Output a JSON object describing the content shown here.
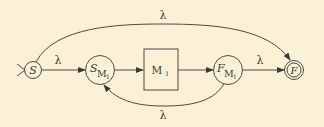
{
  "diagram": {
    "type": "state-transition (NFA construction for M1*)",
    "colors": {
      "background": "#fbf1d6",
      "stroke": "#4a4a4a",
      "text": "#3a3a3a"
    },
    "nodes": [
      {
        "id": "S",
        "label": "S",
        "kind": "start-state"
      },
      {
        "id": "S_M1",
        "label": "S",
        "sub": "M",
        "subsub": "1",
        "kind": "state"
      },
      {
        "id": "M1",
        "label": "M",
        "sub": "1",
        "kind": "machine-box"
      },
      {
        "id": "F_M1",
        "label": "F",
        "sub": "M",
        "subsub": "1",
        "kind": "state"
      },
      {
        "id": "F",
        "label": "F",
        "kind": "accept-state"
      }
    ],
    "edges": [
      {
        "from": "S",
        "to": "S_M1",
        "label": "λ"
      },
      {
        "from": "S_M1",
        "to": "M1",
        "label": ""
      },
      {
        "from": "M1",
        "to": "F_M1",
        "label": ""
      },
      {
        "from": "F_M1",
        "to": "F",
        "label": "λ"
      },
      {
        "from": "S",
        "to": "F",
        "label": "λ",
        "curve": "top"
      },
      {
        "from": "F_M1",
        "to": "S_M1",
        "label": "λ",
        "curve": "bottom"
      }
    ]
  }
}
